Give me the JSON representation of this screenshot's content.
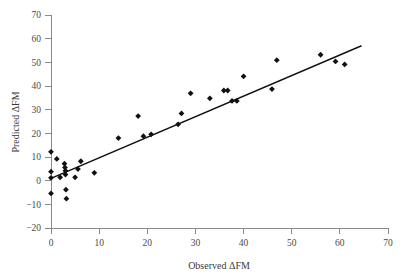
{
  "chart_data": {
    "type": "scatter",
    "title": "",
    "xlabel": "Observed ΔFM",
    "ylabel": "Predicted ΔFM",
    "xlim": [
      0,
      70
    ],
    "ylim": [
      -20,
      70
    ],
    "xticks": [
      0,
      10,
      20,
      30,
      40,
      50,
      60,
      70
    ],
    "yticks": [
      -20,
      -10,
      0,
      10,
      20,
      30,
      40,
      50,
      60,
      70
    ],
    "xtick_labels": [
      "0",
      "10",
      "20",
      "30",
      "40",
      "50",
      "60",
      "70"
    ],
    "ytick_labels": [
      "−20",
      "−10",
      "0",
      "10",
      "20",
      "30",
      "40",
      "50",
      "60",
      "70"
    ],
    "grid": false,
    "legend": null,
    "marker": "diamond",
    "marker_color": "#111111",
    "line_color": "#111111",
    "points": [
      {
        "x": 0.0,
        "y": 12.2
      },
      {
        "x": 0.0,
        "y": 3.8
      },
      {
        "x": 0.0,
        "y": 1.2
      },
      {
        "x": 0.0,
        "y": -5.4
      },
      {
        "x": 1.2,
        "y": 9.2
      },
      {
        "x": 1.9,
        "y": 1.4
      },
      {
        "x": 2.8,
        "y": 7.2
      },
      {
        "x": 2.9,
        "y": 5.6
      },
      {
        "x": 3.0,
        "y": 4.2
      },
      {
        "x": 3.0,
        "y": 2.6
      },
      {
        "x": 3.1,
        "y": -3.8
      },
      {
        "x": 3.2,
        "y": -7.6
      },
      {
        "x": 5.0,
        "y": 1.4
      },
      {
        "x": 5.6,
        "y": 4.9
      },
      {
        "x": 6.2,
        "y": 8.2
      },
      {
        "x": 9.0,
        "y": 3.3
      },
      {
        "x": 14.0,
        "y": 18.0
      },
      {
        "x": 18.1,
        "y": 27.3
      },
      {
        "x": 19.2,
        "y": 18.8
      },
      {
        "x": 20.8,
        "y": 19.6
      },
      {
        "x": 26.4,
        "y": 23.8
      },
      {
        "x": 27.1,
        "y": 28.4
      },
      {
        "x": 29.0,
        "y": 36.9
      },
      {
        "x": 33.0,
        "y": 34.8
      },
      {
        "x": 35.9,
        "y": 38.1
      },
      {
        "x": 36.7,
        "y": 38.1
      },
      {
        "x": 37.6,
        "y": 33.7
      },
      {
        "x": 38.6,
        "y": 33.7
      },
      {
        "x": 40.0,
        "y": 44.1
      },
      {
        "x": 45.9,
        "y": 38.7
      },
      {
        "x": 46.9,
        "y": 50.9
      },
      {
        "x": 56.0,
        "y": 53.2
      },
      {
        "x": 59.1,
        "y": 50.4
      },
      {
        "x": 61.0,
        "y": 49.1
      }
    ],
    "fit_line": {
      "x_start": 0.0,
      "y_start": 1.0,
      "x_end": 64.5,
      "y_end": 57.0
    }
  }
}
